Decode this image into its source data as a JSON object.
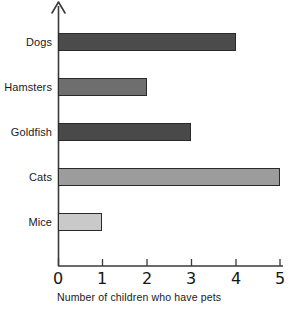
{
  "chart_data": {
    "type": "bar",
    "orientation": "horizontal",
    "title": "",
    "xlabel": "Number of children who have pets",
    "ylabel": "",
    "categories": [
      "Dogs",
      "Hamsters",
      "Goldfish",
      "Cats",
      "Mice"
    ],
    "values": [
      4,
      2,
      3,
      5,
      1
    ],
    "xlim": [
      0,
      5
    ],
    "xticks": [
      "0",
      "1",
      "2",
      "3",
      "4",
      "5"
    ],
    "grid": false,
    "legend": null,
    "bar_colors": [
      "#4b4b4b",
      "#6e6e6e",
      "#494949",
      "#9c9c9c",
      "#c9c9c9"
    ],
    "bar_outline": "#2a2a2a",
    "axis_color": "#3a3a3a",
    "background": "#ffffff"
  },
  "axis": {
    "y_arrow": "up-arrow-icon",
    "x_axis_name": "x-axis-line",
    "y_axis_name": "y-axis-line"
  }
}
